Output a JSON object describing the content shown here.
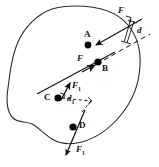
{
  "figure": {
    "type": "physics-diagram",
    "body_shape": "irregular closed blob outline",
    "points": [
      {
        "id": "A",
        "label": "A",
        "x": 88,
        "y": 45,
        "label_x": 84,
        "label_y": 32
      },
      {
        "id": "B",
        "label": "B",
        "x": 98,
        "y": 62,
        "label_x": 101,
        "label_y": 66
      },
      {
        "id": "C",
        "label": "C",
        "x": 58,
        "y": 98,
        "label_x": 44,
        "label_y": 94
      },
      {
        "id": "D",
        "label": "D",
        "x": 73,
        "y": 127,
        "label_x": 78,
        "label_y": 123
      }
    ],
    "forces": [
      {
        "id": "F-top",
        "label": "F",
        "sub": "",
        "label_x": 119,
        "label_y": 10,
        "applies_to": "A"
      },
      {
        "id": "F-at-B",
        "label": "F",
        "sub": "",
        "label_x": 79,
        "label_y": 56,
        "applies_to": "B"
      },
      {
        "id": "F1-at-C",
        "label": "F",
        "sub": "1",
        "label_x": 72,
        "label_y": 84,
        "applies_to": "C"
      },
      {
        "id": "F1-at-D",
        "label": "F",
        "sub": "1",
        "label_x": 77,
        "label_y": 148,
        "applies_to": "D"
      }
    ],
    "distances": [
      {
        "id": "d",
        "label": "d",
        "sub": "",
        "label_x": 139,
        "label_y": 30,
        "kind": "moment-arm",
        "style": "bracket"
      },
      {
        "id": "d1",
        "label": "d",
        "sub": "1",
        "label_x": 68,
        "label_y": 97,
        "kind": "moment-arm",
        "style": "dashed"
      }
    ],
    "colors": {
      "outline": "#2b2b2b",
      "point": "#000000",
      "arrow": "#111111",
      "label": "#111111",
      "background": "#ffffff"
    }
  }
}
